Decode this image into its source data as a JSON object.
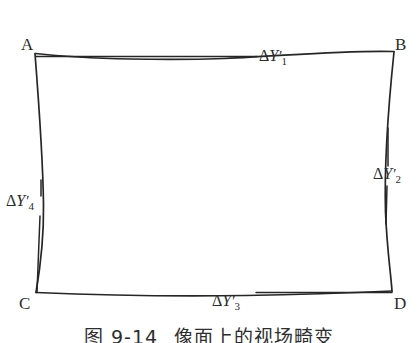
{
  "figure": {
    "type": "geometry-diagram",
    "stroke_color": "#262626",
    "background_color": "#ffffff",
    "corners": [
      {
        "id": "A",
        "label": "A",
        "x": 35,
        "y": 53,
        "label_x": 21,
        "label_y": 36
      },
      {
        "id": "B",
        "label": "B",
        "x": 394,
        "y": 52,
        "label_x": 395,
        "label_y": 36
      },
      {
        "id": "C",
        "label": "C",
        "x": 36,
        "y": 293,
        "label_x": 19,
        "label_y": 295
      },
      {
        "id": "D",
        "label": "D",
        "x": 392,
        "y": 291,
        "label_x": 394,
        "label_y": 295
      }
    ],
    "annotations": [
      {
        "id": "dy1",
        "greek": "Δ",
        "variable": "Y",
        "prime": "′",
        "subscript": "1",
        "text": "ΔY′1",
        "label_x": 259,
        "label_y": 48,
        "leader": {
          "x1": 36,
          "y1": 56,
          "x2": 257,
          "y2": 56,
          "orientation": "horizontal"
        }
      },
      {
        "id": "dy2",
        "greek": "Δ",
        "variable": "Y",
        "prime": "′",
        "subscript": "2",
        "text": "ΔY′2",
        "label_x": 373,
        "label_y": 166,
        "leader": {
          "x1": 388,
          "y1": 128,
          "x2": 388,
          "y2": 222,
          "orientation": "vertical"
        }
      },
      {
        "id": "dy3",
        "greek": "Δ",
        "variable": "Y",
        "prime": "′",
        "subscript": "3",
        "text": "ΔY′3",
        "label_x": 212,
        "label_y": 293,
        "leader": {
          "x1": 256,
          "y1": 292,
          "x2": 392,
          "y2": 292,
          "orientation": "horizontal"
        }
      },
      {
        "id": "dy4",
        "greek": "Δ",
        "variable": "Y",
        "prime": "′",
        "subscript": "4",
        "text": "ΔY′4",
        "label_x": 6,
        "label_y": 193,
        "leader": {
          "x1": 41,
          "y1": 180,
          "x2": 40,
          "y2": 292,
          "orientation": "vertical"
        }
      }
    ],
    "edges": [
      {
        "id": "edge-ab",
        "from": "A",
        "to": "B",
        "shape": "curved-sag"
      },
      {
        "id": "edge-bd",
        "from": "B",
        "to": "D",
        "shape": "curved-bow-left"
      },
      {
        "id": "edge-cd",
        "from": "C",
        "to": "D",
        "shape": "curved-sag"
      },
      {
        "id": "edge-ac",
        "from": "A",
        "to": "C",
        "shape": "curved-bow-right"
      }
    ]
  },
  "caption": {
    "number": "图 9-14",
    "title": "像面上的视场畸变",
    "full": "图 9-14　像面上的视场畸变"
  }
}
